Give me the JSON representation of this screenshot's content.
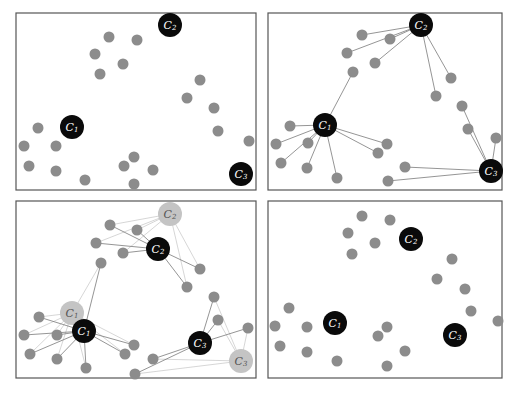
{
  "figure": {
    "caption": "",
    "colors": {
      "point": "#8c8c8c",
      "centroid": "#0a0a0a",
      "old_centroid": "#c4c4c4",
      "frame": "#555555",
      "line": "#7a7a7a",
      "old_line": "#cccccc"
    },
    "point_radius": 5.5,
    "centroid_radius": 12
  },
  "panels": [
    {
      "id": "panel-1-initial",
      "frame": {
        "x": 16,
        "y": 13,
        "w": 240,
        "h": 177
      },
      "points": [
        [
          109,
          37
        ],
        [
          137,
          40
        ],
        [
          95,
          54
        ],
        [
          123,
          64
        ],
        [
          100,
          74
        ],
        [
          200,
          80
        ],
        [
          187,
          98
        ],
        [
          214,
          108
        ],
        [
          218,
          131
        ],
        [
          249,
          141
        ],
        [
          38,
          128
        ],
        [
          24,
          146
        ],
        [
          56,
          146
        ],
        [
          29,
          166
        ],
        [
          56,
          171
        ],
        [
          85,
          180
        ],
        [
          134,
          157
        ],
        [
          124,
          166
        ],
        [
          153,
          170
        ],
        [
          134,
          184
        ]
      ],
      "centroids": [
        {
          "label": "C1",
          "sub": "1",
          "x": 72,
          "y": 127
        },
        {
          "label": "C2",
          "sub": "2",
          "x": 170,
          "y": 25
        },
        {
          "label": "C3",
          "sub": "3",
          "x": 241,
          "y": 174
        }
      ],
      "old_centroids": [],
      "assignments": []
    },
    {
      "id": "panel-2-assignment",
      "frame": {
        "x": 268,
        "y": 13,
        "w": 234,
        "h": 177
      },
      "points": [
        [
          362,
          35
        ],
        [
          390,
          39
        ],
        [
          347,
          53
        ],
        [
          375,
          63
        ],
        [
          353,
          72
        ],
        [
          451,
          78
        ],
        [
          436,
          96
        ],
        [
          462,
          106
        ],
        [
          468,
          129
        ],
        [
          496,
          138
        ],
        [
          290,
          126
        ],
        [
          276,
          144
        ],
        [
          308,
          143
        ],
        [
          281,
          163
        ],
        [
          307,
          168
        ],
        [
          337,
          178
        ],
        [
          387,
          144
        ],
        [
          378,
          153
        ],
        [
          405,
          167
        ],
        [
          388,
          181
        ]
      ],
      "centroids": [
        {
          "label": "C1",
          "sub": "1",
          "x": 325,
          "y": 125
        },
        {
          "label": "C2",
          "sub": "2",
          "x": 421,
          "y": 25
        },
        {
          "label": "C3",
          "sub": "3",
          "x": 491,
          "y": 171
        }
      ],
      "old_centroids": [],
      "assignments": [
        {
          "c": 1,
          "p": [
            0,
            1,
            2,
            3,
            5,
            6
          ]
        },
        {
          "c": 0,
          "p": [
            4,
            10,
            11,
            12,
            13,
            14,
            15,
            16,
            17
          ]
        },
        {
          "c": 2,
          "p": [
            7,
            8,
            9,
            18,
            19
          ]
        }
      ]
    },
    {
      "id": "panel-3-update",
      "frame": {
        "x": 16,
        "y": 201,
        "w": 240,
        "h": 177
      },
      "points": [
        [
          110,
          225
        ],
        [
          137,
          230
        ],
        [
          96,
          243
        ],
        [
          123,
          253
        ],
        [
          101,
          263
        ],
        [
          200,
          269
        ],
        [
          187,
          287
        ],
        [
          214,
          297
        ],
        [
          218,
          320
        ],
        [
          248,
          328
        ],
        [
          39,
          317
        ],
        [
          24,
          335
        ],
        [
          57,
          335
        ],
        [
          30,
          354
        ],
        [
          57,
          359
        ],
        [
          86,
          368
        ],
        [
          134,
          345
        ],
        [
          125,
          354
        ],
        [
          153,
          359
        ],
        [
          135,
          374
        ]
      ],
      "centroids": [
        {
          "label": "C1",
          "sub": "1",
          "x": 84,
          "y": 331
        },
        {
          "label": "C2",
          "sub": "2",
          "x": 158,
          "y": 249
        },
        {
          "label": "C3",
          "sub": "3",
          "x": 200,
          "y": 343
        }
      ],
      "old_centroids": [
        {
          "label": "C1",
          "sub": "1",
          "x": 72,
          "y": 313
        },
        {
          "label": "C2",
          "sub": "2",
          "x": 170,
          "y": 214
        },
        {
          "label": "C3",
          "sub": "3",
          "x": 241,
          "y": 361
        }
      ],
      "assignments": [
        {
          "c": 1,
          "p": [
            0,
            1,
            2,
            3,
            5,
            6
          ]
        },
        {
          "c": 0,
          "p": [
            4,
            10,
            11,
            12,
            13,
            14,
            15,
            16,
            17
          ]
        },
        {
          "c": 2,
          "p": [
            7,
            8,
            9,
            18,
            19
          ]
        }
      ]
    },
    {
      "id": "panel-4-result",
      "frame": {
        "x": 268,
        "y": 201,
        "w": 234,
        "h": 177
      },
      "points": [
        [
          362,
          216
        ],
        [
          390,
          220
        ],
        [
          348,
          233
        ],
        [
          375,
          243
        ],
        [
          352,
          254
        ],
        [
          452,
          259
        ],
        [
          437,
          279
        ],
        [
          465,
          289
        ],
        [
          471,
          311
        ],
        [
          498,
          321
        ],
        [
          289,
          308
        ],
        [
          275,
          326
        ],
        [
          307,
          327
        ],
        [
          280,
          346
        ],
        [
          307,
          352
        ],
        [
          337,
          361
        ],
        [
          387,
          327
        ],
        [
          378,
          336
        ],
        [
          405,
          351
        ],
        [
          387,
          366
        ]
      ],
      "centroids": [
        {
          "label": "C1",
          "sub": "1",
          "x": 335,
          "y": 323
        },
        {
          "label": "C2",
          "sub": "2",
          "x": 411,
          "y": 239
        },
        {
          "label": "C3",
          "sub": "3",
          "x": 455,
          "y": 335
        }
      ],
      "old_centroids": [],
      "assignments": []
    }
  ]
}
